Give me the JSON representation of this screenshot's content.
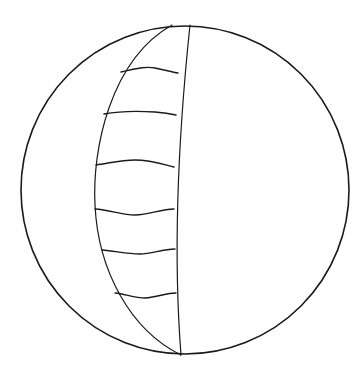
{
  "figure": {
    "type": "line-drawing",
    "background": "#ffffff",
    "stroke_color": "#1a1a1a",
    "circle": {
      "cx": 185,
      "cy": 190,
      "r": 164,
      "stroke_width": 1.6
    },
    "lune_left_path": "M 172 25 C 110 60, 92 150, 95 205 C 98 270, 130 330, 181 355",
    "lune_right_path": "M 190 25 C 180 120, 172 240, 181 355",
    "rungs": [
      "M 121 72 C 135 69, 145 66, 155 68 C 165 70, 172 72, 178 73",
      "M 104 114 C 120 111, 140 111, 155 112 C 165 113, 171 114, 176 115",
      "M 96 165 C 110 163, 122 160, 135 160 C 150 160, 162 164, 174 167",
      "M 95 209 C 110 210, 122 215, 135 215 C 150 215, 160 209, 174 209",
      "M 102 250 C 115 251, 127 254, 140 254 C 152 254, 162 249, 175 249",
      "M 115 293 C 125 294, 135 298, 145 298 C 158 297, 166 293, 176 293"
    ],
    "rung_stroke_width": 1.4,
    "lune_stroke_width": 1.2
  }
}
